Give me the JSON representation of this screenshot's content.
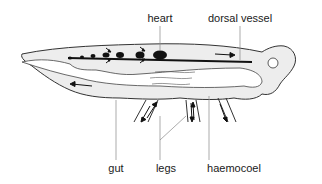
{
  "diagram": {
    "type": "insect open circulatory system",
    "labels": {
      "heart": "heart",
      "dorsal_vessel": "dorsal vessel",
      "gut": "gut",
      "legs": "legs",
      "haemocoel": "haemocoel"
    },
    "colors": {
      "body_fill": "#ededed",
      "outline": "#333333",
      "vessel": "#111111",
      "leader_line": "#888888",
      "text": "#1a1a1a"
    }
  }
}
